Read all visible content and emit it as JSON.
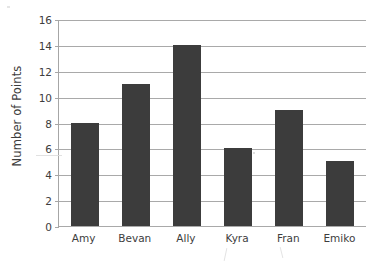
{
  "chart_data": {
    "type": "bar",
    "title": "",
    "subtitle": "",
    "xlabel": "",
    "ylabel": "Number of Points",
    "categories": [
      "Amy",
      "Bevan",
      "Ally",
      "Kyra",
      "Fran",
      "Emiko"
    ],
    "values": [
      8,
      11,
      14,
      6,
      9,
      5
    ],
    "series": [
      {
        "name": "Number of Points",
        "values": [
          8,
          11,
          14,
          6,
          9,
          5
        ]
      }
    ],
    "ylim": [
      0,
      16
    ],
    "xlim": [
      0,
      6
    ],
    "y_ticks": [
      0,
      2,
      4,
      6,
      8,
      10,
      12,
      14,
      16
    ],
    "y_tick_labels": [
      "0",
      "2",
      "4",
      "6",
      "8",
      "10",
      "12",
      "14",
      "16"
    ],
    "grid": true,
    "grid_axis": "y",
    "legend": false,
    "legend_position": "none",
    "bar_color": "#3c3c3c",
    "grid_color": "#a9a9a9",
    "axis_color": "#a6a6a6",
    "background_color": "#ffffff",
    "text_color": "#3d3d3d",
    "annotations": []
  }
}
